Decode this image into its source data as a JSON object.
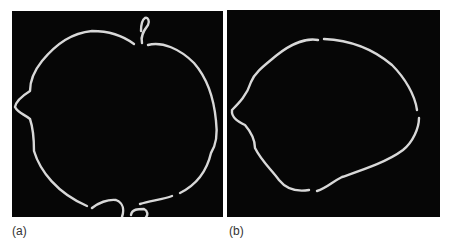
{
  "figure": {
    "panels": [
      {
        "label": "(a)",
        "description": "binary edge image of a roughly circular contour with a protrusion at top and an irregular region at bottom"
      },
      {
        "label": "(b)",
        "description": "smoothed closed contour, roughly oval shape"
      }
    ],
    "colors": {
      "background": "#060606",
      "contour": "#d8d8d8"
    }
  }
}
